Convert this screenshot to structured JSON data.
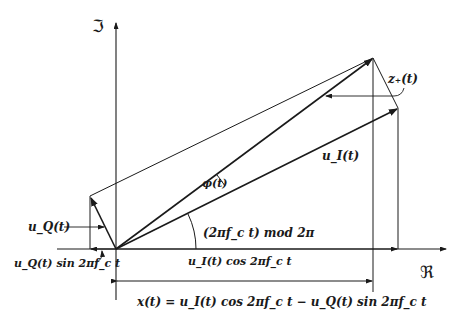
{
  "axes": {
    "imaginary_label": "ℑ",
    "real_label": "ℜ"
  },
  "labels": {
    "z_plus": "z₊(t)",
    "u_I": "u_I(t)",
    "u_Q": "u_Q(t)",
    "phi": "φ(t)",
    "carrier_angle": "(2πf_c t) mod 2π",
    "u_Q_sin": "u_Q(t) sin 2πf_c t",
    "u_I_cos": "u_I(t) cos 2πf_c t",
    "x_eq": "x(t) = u_I(t) cos 2πf_c t − u_Q(t) sin 2πf_c t"
  },
  "geometry": {
    "origin": [
      116,
      249
    ],
    "z_plus_tip": [
      373,
      58
    ],
    "u_I_tip": [
      398,
      108
    ],
    "u_Q_tip": [
      90,
      196
    ]
  },
  "colors": {
    "ink": "#1a1a1a",
    "background": "#ffffff"
  }
}
